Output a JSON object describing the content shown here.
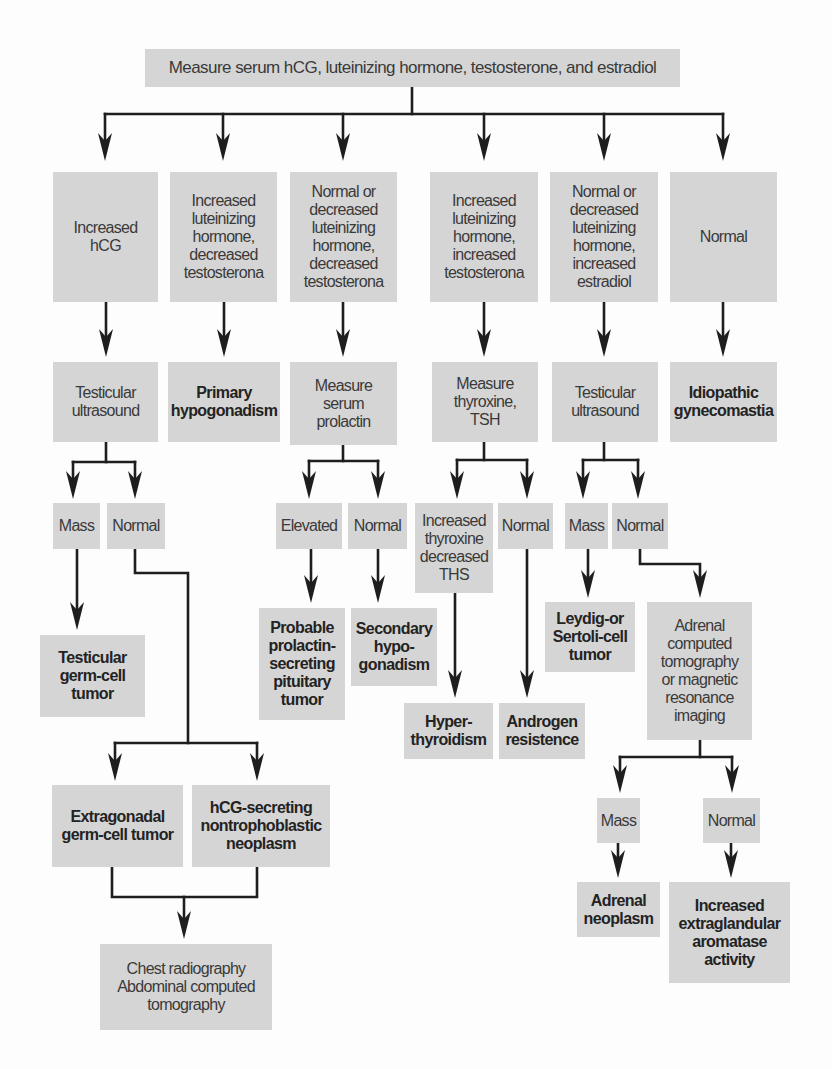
{
  "colors": {
    "box_fill": "#d5d5d5",
    "connector": "#1e1e1e",
    "text": "#3a3a3a",
    "text_bold": "#232323",
    "background": "#fdfdfd"
  },
  "nodes": {
    "root": {
      "text": "Measure serum hCG, luteinizing hormone, testosterone, and estradiol"
    },
    "r1_increased_hcg": {
      "text": "Increased\nhCG"
    },
    "r1_inc_lh_dec_t": {
      "text": "Increased\nluteinizing\nhormone,\ndecreased\ntestosterona"
    },
    "r1_norm_lh_dec_t": {
      "text": "Normal or\ndecreased\nluteinizing\nhormone,\ndecreased\ntestosterona"
    },
    "r1_inc_lh_inc_t": {
      "text": "Increased\nluteinizing\nhormone,\nincreased\ntestosterona"
    },
    "r1_norm_lh_inc_e": {
      "text": "Normal or\ndecreased\nluteinizing\nhormone,\nincreased\nestradiol"
    },
    "r1_normal": {
      "text": "Normal"
    },
    "c1_testicular_us": {
      "text": "Testicular\nultrasound"
    },
    "c1_mass": {
      "text": "Mass"
    },
    "c1_normal": {
      "text": "Normal"
    },
    "c1_testicular_gct": {
      "text": "Testicular\ngerm-cell\ntumor"
    },
    "c1_extragonadal_gct": {
      "text": "Extragonadal\ngerm-cell tumor"
    },
    "c1_hcg_secreting": {
      "text": "hCG-secreting\nnontrophoblastic\nneoplasm"
    },
    "c1_chest_abdominal": {
      "text": "Chest radiography\nAbdominal computed\ntomography"
    },
    "c2_primary_hypogonadism": {
      "text": "Primary\nhypogonadism"
    },
    "c3_measure_prolactin": {
      "text": "Measure\nserum\nprolactin"
    },
    "c3_elevated": {
      "text": "Elevated"
    },
    "c3_normal": {
      "text": "Normal"
    },
    "c3_prolactinoma": {
      "text": "Probable\nprolactin-\nsecreting\npituitary\ntumor"
    },
    "c3_secondary_hypogonadism": {
      "text": "Secondary\nhypo-\ngonadism"
    },
    "c4_measure_thyroxine": {
      "text": "Measure\nthyroxine,\nTSH"
    },
    "c4_inc_thyroxine": {
      "text": "Increased\nthyroxine\ndecreased\nTHS"
    },
    "c4_normal": {
      "text": "Normal"
    },
    "c4_hyperthyroidism": {
      "text": "Hyper-\nthyroidism"
    },
    "c4_androgen_resistence": {
      "text": "Androgen\nresistence"
    },
    "c5_testicular_us": {
      "text": "Testicular\nultrasound"
    },
    "c5_mass": {
      "text": "Mass"
    },
    "c5_normal": {
      "text": "Normal"
    },
    "c5_leydig_sertoli": {
      "text": "Leydig-or\nSertoli-cell\ntumor"
    },
    "c5_adrenal_imaging": {
      "text": "Adrenal\ncomputed\ntomography\nor magnetic\nresonance\nimaging"
    },
    "c5_adrenal_mass": {
      "text": "Mass"
    },
    "c5_adrenal_normal": {
      "text": "Normal"
    },
    "c5_adrenal_neoplasm": {
      "text": "Adrenal\nneoplasm"
    },
    "c5_aromatase": {
      "text": "Increased\nextraglandular\naromatase\nactivity"
    },
    "c6_idiopathic": {
      "text": "Idiopathic\ngynecomastia"
    }
  },
  "edges": [
    [
      "root",
      "r1_increased_hcg"
    ],
    [
      "root",
      "r1_inc_lh_dec_t"
    ],
    [
      "root",
      "r1_norm_lh_dec_t"
    ],
    [
      "root",
      "r1_inc_lh_inc_t"
    ],
    [
      "root",
      "r1_norm_lh_inc_e"
    ],
    [
      "root",
      "r1_normal"
    ],
    [
      "r1_increased_hcg",
      "c1_testicular_us"
    ],
    [
      "c1_testicular_us",
      "c1_mass"
    ],
    [
      "c1_testicular_us",
      "c1_normal"
    ],
    [
      "c1_mass",
      "c1_testicular_gct"
    ],
    [
      "c1_normal",
      "c1_extragonadal_gct"
    ],
    [
      "c1_normal",
      "c1_hcg_secreting"
    ],
    [
      "c1_extragonadal_gct",
      "c1_chest_abdominal"
    ],
    [
      "c1_hcg_secreting",
      "c1_chest_abdominal"
    ],
    [
      "r1_inc_lh_dec_t",
      "c2_primary_hypogonadism"
    ],
    [
      "r1_norm_lh_dec_t",
      "c3_measure_prolactin"
    ],
    [
      "c3_measure_prolactin",
      "c3_elevated"
    ],
    [
      "c3_measure_prolactin",
      "c3_normal"
    ],
    [
      "c3_elevated",
      "c3_prolactinoma"
    ],
    [
      "c3_normal",
      "c3_secondary_hypogonadism"
    ],
    [
      "r1_inc_lh_inc_t",
      "c4_measure_thyroxine"
    ],
    [
      "c4_measure_thyroxine",
      "c4_inc_thyroxine"
    ],
    [
      "c4_measure_thyroxine",
      "c4_normal"
    ],
    [
      "c4_inc_thyroxine",
      "c4_hyperthyroidism"
    ],
    [
      "c4_normal",
      "c4_androgen_resistence"
    ],
    [
      "r1_norm_lh_inc_e",
      "c5_testicular_us"
    ],
    [
      "c5_testicular_us",
      "c5_mass"
    ],
    [
      "c5_testicular_us",
      "c5_normal"
    ],
    [
      "c5_mass",
      "c5_leydig_sertoli"
    ],
    [
      "c5_normal",
      "c5_adrenal_imaging"
    ],
    [
      "c5_adrenal_imaging",
      "c5_adrenal_mass"
    ],
    [
      "c5_adrenal_imaging",
      "c5_adrenal_normal"
    ],
    [
      "c5_adrenal_mass",
      "c5_adrenal_neoplasm"
    ],
    [
      "c5_adrenal_normal",
      "c5_aromatase"
    ],
    [
      "r1_normal",
      "c6_idiopathic"
    ]
  ]
}
